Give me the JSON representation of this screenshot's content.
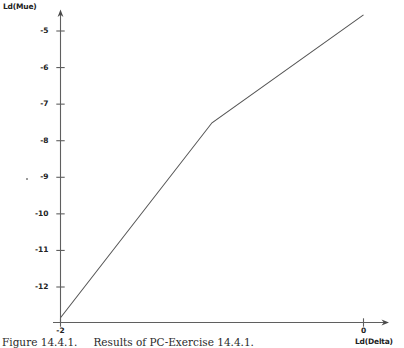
{
  "figure": {
    "caption_number": "Figure 14.4.1.",
    "caption_text": "Results of PC-Exercise 14.4.1."
  },
  "axes": {
    "y_title": "Ld(Mue)",
    "x_title": "Ld(Delta)"
  },
  "chart_data": {
    "type": "line",
    "title": "",
    "xlabel": "Ld(Delta)",
    "ylabel": "Ld(Mue)",
    "xlim": [
      -2.06,
      0.2
    ],
    "ylim": [
      -13.0,
      -4.3
    ],
    "grid": false,
    "legend": null,
    "x_ticks": [
      -2,
      0
    ],
    "x_tick_labels": [
      "-2",
      "0"
    ],
    "y_ticks": [
      -5,
      -6,
      -7,
      -8,
      -9,
      -10,
      -11,
      -12
    ],
    "y_tick_labels": [
      "-5",
      "-6",
      "-7",
      "-8",
      "-9",
      "-10",
      "-11",
      "-12"
    ],
    "series": [
      {
        "name": "Ld(Mue) vs Ld(Delta)",
        "color": "#555555",
        "x": [
          -2.0,
          -1.0,
          0.0
        ],
        "y": [
          -12.84,
          -7.51,
          -4.56
        ]
      }
    ]
  }
}
